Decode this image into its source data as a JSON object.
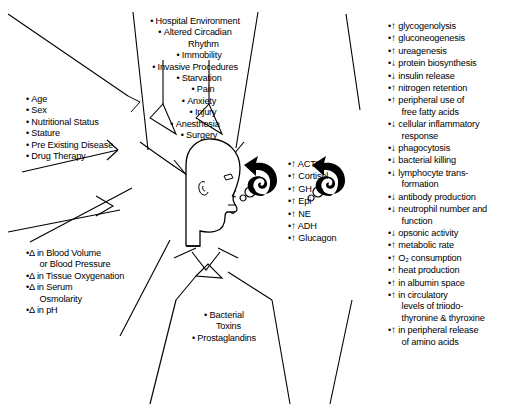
{
  "diagram": {
    "center_figure": "human-head-profile",
    "arrow_glyph_up": "↑",
    "arrow_glyph_down": "↓",
    "delta_glyph": "Δ",
    "bullet_glyph": "•",
    "ink_color": "#000000",
    "background_color": "#ffffff"
  },
  "patient_factors": {
    "name": "patient-factors",
    "items": [
      {
        "text": "Age"
      },
      {
        "text": "Sex"
      },
      {
        "text": "Nutritional Status"
      },
      {
        "text": "Stature"
      },
      {
        "text": "Pre Existing Disease"
      },
      {
        "text": "Drug Therapy"
      }
    ]
  },
  "environmental_factors": {
    "name": "environmental-and-procedural-factors",
    "items": [
      {
        "text": "Hospital Environment",
        "indent": 0
      },
      {
        "text": "Altered Circadian",
        "indent": 0
      },
      {
        "text": "Rhythm",
        "indent": 1,
        "continuation": true
      },
      {
        "text": "Immobility",
        "indent": 1
      },
      {
        "text": "Invasive Procedures",
        "indent": 0
      },
      {
        "text": "Starvation",
        "indent": 1
      },
      {
        "text": "Pain",
        "indent": 2
      },
      {
        "text": "Anxiety",
        "indent": 1
      },
      {
        "text": "Injury",
        "indent": 2
      },
      {
        "text": "Anesthesia",
        "indent": 0
      },
      {
        "text": "Surgery",
        "indent": 1
      }
    ]
  },
  "physiologic_changes": {
    "name": "physiologic-changes",
    "items": [
      {
        "delta": true,
        "text": "in Blood Volume"
      },
      {
        "delta": false,
        "text": "or Blood Pressure",
        "continuation": true
      },
      {
        "delta": true,
        "text": "in Tissue Oxygenation"
      },
      {
        "delta": true,
        "text": "in Serum"
      },
      {
        "delta": false,
        "text": "Osmolarity",
        "continuation": true
      },
      {
        "delta": true,
        "text": "in pH"
      }
    ]
  },
  "mediators": {
    "name": "bacterial-mediators",
    "items": [
      {
        "text": "Bacterial"
      },
      {
        "text": "Toxins",
        "continuation": true
      },
      {
        "text": "Prostaglandins"
      }
    ]
  },
  "hormones": {
    "name": "hormone-response",
    "items": [
      {
        "dir": "up",
        "text": "ACTH"
      },
      {
        "dir": "up",
        "text": "Cortisol"
      },
      {
        "dir": "up",
        "text": "GH"
      },
      {
        "dir": "up",
        "text": "Epi"
      },
      {
        "dir": "up",
        "text": "NE"
      },
      {
        "dir": "up",
        "text": "ADH"
      },
      {
        "dir": "up",
        "text": "Glucagon"
      }
    ]
  },
  "metabolic_effects": {
    "name": "metabolic-and-immune-effects",
    "items": [
      {
        "dir": "up",
        "text": "glycogenolysis"
      },
      {
        "dir": "up",
        "text": "gluconeogenesis"
      },
      {
        "dir": "up",
        "text": "ureagenesis"
      },
      {
        "dir": "down",
        "text": "protein biosynthesis"
      },
      {
        "dir": "down",
        "text": "insulin release"
      },
      {
        "dir": "up",
        "text": "nitrogen retention"
      },
      {
        "dir": "up",
        "text": "peripheral use of"
      },
      {
        "dir": null,
        "text": "free fatty acids",
        "continuation": true
      },
      {
        "dir": "down",
        "text": "cellular inflammatory"
      },
      {
        "dir": null,
        "text": "response",
        "continuation": true
      },
      {
        "dir": "down",
        "text": "phagocytosis"
      },
      {
        "dir": "down",
        "text": "bacterial killing"
      },
      {
        "dir": "down",
        "text": "lymphocyte trans-"
      },
      {
        "dir": null,
        "text": "formation",
        "continuation": true
      },
      {
        "dir": "down",
        "text": "antibody production"
      },
      {
        "dir": "down",
        "text": "neutrophil number and"
      },
      {
        "dir": null,
        "text": "function",
        "continuation": true
      },
      {
        "dir": "down",
        "text": "opsonic activity"
      },
      {
        "dir": "up",
        "text": "metabolic rate"
      },
      {
        "dir": "up",
        "text": "O₂ consumption"
      },
      {
        "dir": "up",
        "text": "heat production"
      },
      {
        "dir": "up",
        "text": "in albumin space"
      },
      {
        "dir": "up",
        "text": "in circulatory"
      },
      {
        "dir": null,
        "text": "levels of triiodo-",
        "continuation": true
      },
      {
        "dir": null,
        "text": "thyronine & thyroxine",
        "continuation": true
      },
      {
        "dir": "up",
        "text": "in peripheral release"
      },
      {
        "dir": null,
        "text": "of amino acids",
        "continuation": true
      }
    ]
  }
}
